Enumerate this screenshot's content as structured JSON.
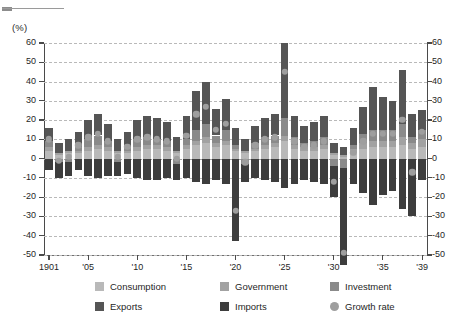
{
  "unit_label": "(%)",
  "legend": {
    "items": [
      {
        "label": "Consumption",
        "color": "#b9b9b9",
        "shape": "square"
      },
      {
        "label": "Government",
        "color": "#a2a2a2",
        "shape": "square"
      },
      {
        "label": "Investment",
        "color": "#8a8a8a",
        "shape": "square"
      },
      {
        "label": "Exports",
        "color": "#555555",
        "shape": "square"
      },
      {
        "label": "Imports",
        "color": "#3d3d3d",
        "shape": "square"
      },
      {
        "label": "Growth rate",
        "color": "#9e9e9e",
        "shape": "circle"
      }
    ]
  },
  "chart_data": {
    "type": "bar",
    "title": "",
    "subtitle": "",
    "xlabel": "",
    "ylabel": "(%)",
    "ylim": [
      -50,
      60
    ],
    "ytick_labels": [
      "60",
      "50",
      "40",
      "30",
      "20",
      "10",
      "0",
      "-10",
      "-20",
      "-30",
      "-40",
      "-50"
    ],
    "ytick_values": [
      60,
      50,
      40,
      30,
      20,
      10,
      0,
      -10,
      -20,
      -30,
      -40,
      -50
    ],
    "grid": true,
    "legend_position": "bottom",
    "dual_axis": true,
    "stacked": true,
    "x": [
      1901,
      1902,
      1903,
      1904,
      1905,
      1906,
      1907,
      1908,
      1909,
      1910,
      1911,
      1912,
      1913,
      1914,
      1915,
      1916,
      1917,
      1918,
      1919,
      1920,
      1921,
      1922,
      1923,
      1924,
      1925,
      1926,
      1927,
      1928,
      1929,
      1930,
      1931,
      1932,
      1933,
      1934,
      1935,
      1936,
      1937,
      1938,
      1939
    ],
    "xtick_labels": [
      "1901",
      "'05",
      "'10",
      "'15",
      "'20",
      "'25",
      "'30",
      "'35",
      "'39"
    ],
    "xtick_values": [
      1901,
      1905,
      1910,
      1915,
      1920,
      1925,
      1930,
      1935,
      1939
    ],
    "series": [
      {
        "name": "Consumption",
        "color": "#b9b9b9",
        "values": [
          4,
          2,
          3,
          3,
          4,
          5,
          4,
          3,
          3,
          4,
          5,
          5,
          4,
          3,
          5,
          7,
          8,
          6,
          7,
          4,
          3,
          4,
          5,
          6,
          9,
          5,
          4,
          4,
          5,
          2,
          1,
          3,
          5,
          6,
          6,
          6,
          7,
          5,
          6
        ]
      },
      {
        "name": "Government",
        "color": "#a2a2a2",
        "values": [
          2,
          1,
          1,
          1,
          2,
          2,
          2,
          1,
          1,
          2,
          2,
          2,
          2,
          1,
          2,
          2,
          3,
          2,
          2,
          1,
          1,
          1,
          2,
          2,
          3,
          2,
          2,
          2,
          2,
          1,
          1,
          2,
          3,
          3,
          3,
          3,
          4,
          3,
          4
        ]
      },
      {
        "name": "Investment",
        "color": "#8a8a8a",
        "values": [
          3,
          -2,
          -2,
          2,
          4,
          5,
          3,
          -2,
          2,
          4,
          4,
          3,
          3,
          -3,
          3,
          6,
          7,
          4,
          6,
          2,
          -3,
          3,
          4,
          4,
          9,
          4,
          2,
          3,
          4,
          -4,
          -5,
          2,
          5,
          6,
          6,
          6,
          7,
          3,
          5
        ]
      },
      {
        "name": "Exports",
        "color": "#555555",
        "values": [
          7,
          5,
          6,
          8,
          10,
          11,
          9,
          6,
          8,
          10,
          11,
          11,
          10,
          7,
          12,
          20,
          22,
          14,
          16,
          9,
          6,
          9,
          10,
          11,
          39,
          11,
          9,
          10,
          11,
          5,
          4,
          9,
          14,
          22,
          17,
          15,
          28,
          12,
          10
        ]
      },
      {
        "name": "Imports",
        "color": "#3d3d3d",
        "values": [
          -6,
          -8,
          -7,
          -6,
          -9,
          -10,
          -9,
          -7,
          -8,
          -10,
          -11,
          -11,
          -10,
          -8,
          -10,
          -12,
          -13,
          -11,
          -13,
          -43,
          -9,
          -10,
          -11,
          -12,
          -15,
          -13,
          -11,
          -12,
          -13,
          -16,
          -50,
          -13,
          -18,
          -24,
          -19,
          -17,
          -26,
          -30,
          -11
        ]
      }
    ],
    "growth_rate": {
      "name": "Growth rate",
      "color": "#9e9e9e",
      "values": [
        10,
        -1,
        1,
        7,
        11,
        13,
        9,
        1,
        6,
        10,
        11,
        10,
        9,
        0,
        12,
        23,
        27,
        15,
        18,
        -27,
        -2,
        7,
        10,
        11,
        45,
        9,
        6,
        7,
        9,
        -12,
        -49,
        3,
        9,
        13,
        13,
        13,
        20,
        -7,
        14
      ]
    }
  }
}
